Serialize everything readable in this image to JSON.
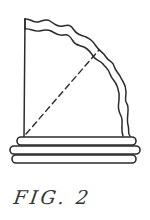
{
  "figure": {
    "caption": "FIG. 2",
    "colors": {
      "ink": "#2b2b2b",
      "background": "#ffffff"
    }
  }
}
